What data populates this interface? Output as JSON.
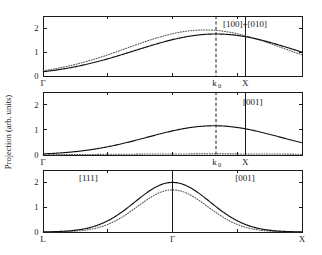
{
  "figure": {
    "ylabel": "Projection (arb. units)",
    "background": "#ffffff",
    "foreground": "#1a1a1a"
  },
  "chart_data": {
    "type": "line",
    "title": "",
    "ylabel": "Projection (arb. units)",
    "xlabel": "",
    "ylim": [
      0,
      2.5
    ],
    "yticks": [
      0,
      1,
      2
    ],
    "ytick_labels": [
      "0",
      "1",
      "2"
    ],
    "grid": false,
    "legend": "none",
    "panels": [
      {
        "id": "panel-1",
        "label": "[100]+[010]",
        "label_x": 0.78,
        "label_y": 2.05,
        "xlim": [
          0,
          1.28
        ],
        "x_ticks": [
          {
            "value": 0,
            "label": "Γ"
          },
          {
            "value": 1.0,
            "label": "X"
          }
        ],
        "x_minor_ticks": [
          0.32,
          0.64,
          0.96
        ],
        "markers": [
          {
            "name": "k0",
            "label": "k",
            "sublabel": "0",
            "value": 0.855,
            "style": "dashed"
          },
          {
            "name": "X",
            "label": "X",
            "value": 1.0,
            "style": "solid"
          }
        ],
        "series": [
          {
            "name": "solid",
            "style": "solid",
            "peak_x": 0.855,
            "peak_y": 1.75,
            "width": 0.4,
            "baseline": 0.0
          },
          {
            "name": "dotted",
            "style": "dotted",
            "peak_x": 0.8,
            "peak_y": 1.92,
            "width": 0.385,
            "baseline": 0.0
          }
        ]
      },
      {
        "id": "panel-2",
        "label": "[001]",
        "label_x": 0.81,
        "label_y": 2.0,
        "xlim": [
          0,
          1.28
        ],
        "x_ticks": [
          {
            "value": 0,
            "label": "Γ"
          },
          {
            "value": 1.0,
            "label": "X"
          }
        ],
        "x_minor_ticks": [
          0.32,
          0.64,
          0.96
        ],
        "markers": [
          {
            "name": "k0",
            "label": "k",
            "sublabel": "0",
            "value": 0.855,
            "style": "dashed"
          },
          {
            "name": "X",
            "label": "X",
            "value": 1.0,
            "style": "solid"
          }
        ],
        "series": [
          {
            "name": "solid",
            "style": "solid",
            "peak_x": 0.845,
            "peak_y": 1.16,
            "width": 0.33,
            "baseline": 0.0
          },
          {
            "name": "dotted",
            "style": "dotted",
            "peak_x": 0.845,
            "peak_y": 0.045,
            "width": 0.52,
            "baseline": 0.0
          }
        ]
      },
      {
        "id": "panel-3",
        "label_left": "[111]",
        "label_right": "[001]",
        "label_left_x": 0.175,
        "label_right_x": 0.78,
        "label_y": 2.05,
        "xlim": [
          0,
          1.0
        ],
        "x_ticks": [
          {
            "value": 0,
            "label": "L"
          },
          {
            "value": 0.5,
            "label": "Γ"
          },
          {
            "value": 1.0,
            "label": "X"
          }
        ],
        "x_minor_ticks": [
          0.25,
          0.75
        ],
        "markers": [
          {
            "name": "Gamma",
            "label": "Γ",
            "value": 0.5,
            "style": "solid"
          }
        ],
        "series": [
          {
            "name": "solid",
            "style": "solid",
            "peak_x": 0.5,
            "peak_y": 2.0,
            "width": 0.145,
            "baseline": 0.0
          },
          {
            "name": "dotted",
            "style": "dotted",
            "peak_x": 0.5,
            "peak_y": 1.7,
            "width": 0.135,
            "baseline": 0.0
          }
        ]
      }
    ]
  }
}
